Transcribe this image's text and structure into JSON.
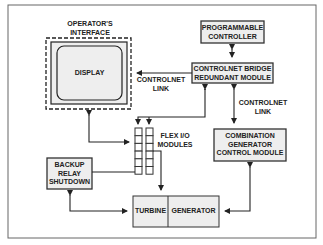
{
  "diagram": {
    "colors": {
      "line": "#333333",
      "box_fill": "#eeeeee",
      "frame": "#666666",
      "text": "#222222"
    },
    "operator_interface": {
      "label_line1": "OPERATOR'S",
      "label_line2": "INTERFACE",
      "display_label": "DISPLAY"
    },
    "programmable_controller": {
      "line1": "PROGRAMMABLE",
      "line2": "CONTROLLER"
    },
    "controlnet_bridge": {
      "line1": "CONTROLNET BRIDGE",
      "line2": "REDUNDANT MODULE"
    },
    "controlnet_link_left": {
      "line1": "CONTROLNET",
      "line2": "LINK"
    },
    "controlnet_link_right": {
      "line1": "CONTROLNET",
      "line2": "LINK"
    },
    "flex_io": {
      "line1": "FLEX I/O",
      "line2": "MODULES",
      "slots_per_column": 6,
      "columns": 2
    },
    "combination_module": {
      "line1": "COMBINATION",
      "line2": "GENERATOR",
      "line3": "CONTROL MODULE"
    },
    "backup_relay": {
      "line1": "BACKUP",
      "line2": "RELAY",
      "line3": "SHUTDOWN"
    },
    "turbine": {
      "label": "TURBINE"
    },
    "generator": {
      "label": "GENERATOR"
    }
  }
}
